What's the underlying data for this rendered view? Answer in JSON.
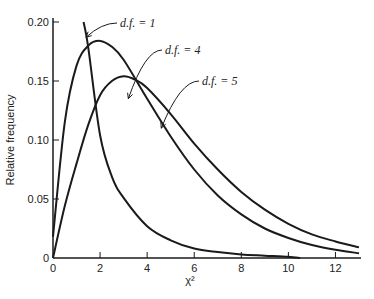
{
  "chart_data": {
    "type": "line",
    "title": "",
    "xlabel": "χ²",
    "ylabel": "Relative frequency",
    "xlim": [
      0,
      13
    ],
    "ylim": [
      0,
      0.2
    ],
    "grid": false,
    "x_ticks": [
      0,
      2,
      4,
      6,
      8,
      10,
      12
    ],
    "x_tick_labels": [
      "0",
      "2",
      "4",
      "6",
      "8",
      "10",
      "12"
    ],
    "y_ticks": [
      0,
      0.05,
      0.1,
      0.15,
      0.2
    ],
    "y_tick_labels": [
      "0",
      "0.05",
      "0.10",
      "0.15",
      "0.20"
    ],
    "series": [
      {
        "name": "d.f. = 1",
        "label": "d.f. = 1",
        "df": 1,
        "x": [
          1.3,
          1.5,
          2,
          2.5,
          3,
          4,
          5,
          6,
          7,
          8,
          9,
          10,
          10.5
        ],
        "y": [
          0.2,
          0.178,
          0.104,
          0.069,
          0.051,
          0.027,
          0.015,
          0.008,
          0.005,
          0.003,
          0.002,
          0.001,
          0.0
        ]
      },
      {
        "name": "d.f. = 4",
        "label": "d.f. = 4",
        "df": 4,
        "x": [
          0,
          0.5,
          1,
          1.5,
          2,
          2.5,
          3,
          4,
          5,
          6,
          7,
          8,
          9,
          10,
          11,
          12,
          13
        ],
        "y": [
          0.018,
          0.115,
          0.163,
          0.18,
          0.184,
          0.179,
          0.168,
          0.135,
          0.103,
          0.075,
          0.053,
          0.037,
          0.025,
          0.017,
          0.011,
          0.007,
          0.004
        ]
      },
      {
        "name": "d.f. = 5",
        "label": "d.f. = 5",
        "df": 5,
        "x": [
          0,
          0.5,
          1,
          1.5,
          2,
          2.5,
          3,
          3.5,
          4,
          5,
          6,
          7,
          8,
          9,
          10,
          11,
          12,
          13
        ],
        "y": [
          0.0,
          0.044,
          0.08,
          0.113,
          0.138,
          0.15,
          0.154,
          0.151,
          0.144,
          0.122,
          0.097,
          0.075,
          0.056,
          0.041,
          0.029,
          0.02,
          0.014,
          0.009
        ]
      }
    ],
    "annotations": [
      {
        "text": "d.f. = 1",
        "points_to": {
          "x": 1.4,
          "y": 0.187
        }
      },
      {
        "text": "d.f. = 4",
        "points_to": {
          "x": 3.2,
          "y": 0.135
        }
      },
      {
        "text": "d.f. = 5",
        "points_to": {
          "x": 4.6,
          "y": 0.11
        }
      }
    ]
  }
}
